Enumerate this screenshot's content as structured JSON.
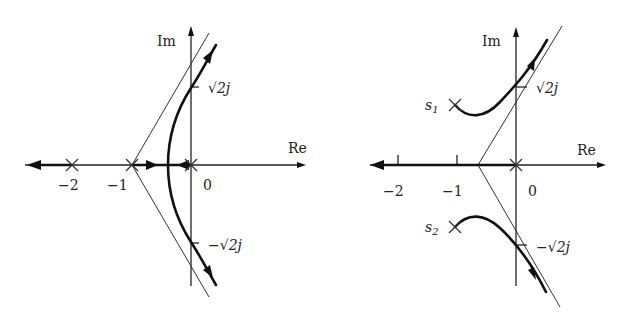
{
  "figure": {
    "left_plot": {
      "axis_labels": {
        "real": "Re",
        "imag": "Im"
      },
      "real_ticks": [
        {
          "label": "−2",
          "value": -2
        },
        {
          "label": "−1",
          "value": -1
        },
        {
          "label": "0",
          "value": 0
        }
      ],
      "imag_ticks": [
        {
          "label": "√2j",
          "value": 1.414
        },
        {
          "label": "−√2j",
          "value": -1.414
        }
      ],
      "poles": [
        {
          "re": -2,
          "im": 0
        },
        {
          "re": -1,
          "im": 0
        },
        {
          "re": 0,
          "im": 0
        }
      ],
      "asymptote_centroid": -1,
      "asymptote_angles_deg": [
        60,
        -60,
        180
      ],
      "breakaway_point_re": -0.42,
      "jw_crossings": [
        "√2j",
        "−√2j"
      ]
    },
    "right_plot": {
      "axis_labels": {
        "real": "Re",
        "imag": "Im"
      },
      "real_ticks": [
        {
          "label": "−2",
          "value": -2
        },
        {
          "label": "−1",
          "value": -1
        },
        {
          "label": "0",
          "value": 0
        }
      ],
      "imag_ticks": [
        {
          "label": "√2j",
          "value": 1.414
        },
        {
          "label": "−√2j",
          "value": -1.414
        }
      ],
      "pole_labels": {
        "s1": "s",
        "s1_sub": "1",
        "s2": "s",
        "s2_sub": "2"
      },
      "poles": [
        {
          "name": "s1",
          "re": -1,
          "im": 1
        },
        {
          "name": "s2",
          "re": -1,
          "im": -1
        },
        {
          "name": "origin",
          "re": 0,
          "im": 0
        }
      ],
      "asymptote_centroid": -0.667,
      "asymptote_angles_deg": [
        60,
        -60,
        180
      ],
      "jw_crossings": [
        "√2j",
        "−√2j"
      ]
    }
  }
}
